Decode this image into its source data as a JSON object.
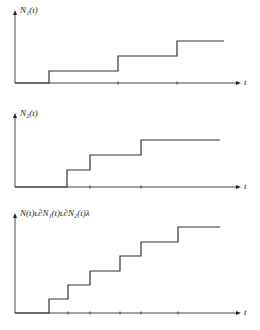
{
  "plots": [
    {
      "ylabel": "N₁(t)",
      "xlabel": "t",
      "axis_y": 83,
      "axis_top": 10,
      "steps": [
        [
          15,
          83
        ],
        [
          49,
          83
        ],
        [
          49,
          71
        ],
        [
          118,
          71
        ],
        [
          118,
          56
        ],
        [
          177,
          56
        ],
        [
          177,
          41
        ],
        [
          224,
          41
        ]
      ],
      "ticks": [
        118,
        177
      ]
    },
    {
      "ylabel": "N₂(t)",
      "xlabel": "t",
      "axis_y": 187,
      "axis_top": 113,
      "steps": [
        [
          15,
          187
        ],
        [
          67,
          187
        ],
        [
          67,
          170
        ],
        [
          90,
          170
        ],
        [
          90,
          155
        ],
        [
          141,
          155
        ],
        [
          141,
          140
        ],
        [
          220,
          140
        ]
      ],
      "ticks": [
        90,
        141
      ]
    },
    {
      "ylabel": "N(t)ʟ∂N₁(t)ʟ∂N₂(t)λ",
      "xlabel": "t",
      "axis_y": 313,
      "axis_top": 213,
      "steps": [
        [
          15,
          313
        ],
        [
          49,
          313
        ],
        [
          49,
          299
        ],
        [
          68,
          299
        ],
        [
          68,
          285
        ],
        [
          90,
          285
        ],
        [
          90,
          271
        ],
        [
          120,
          271
        ],
        [
          120,
          256
        ],
        [
          141,
          256
        ],
        [
          141,
          242
        ],
        [
          178,
          242
        ],
        [
          178,
          227
        ],
        [
          220,
          227
        ]
      ],
      "ticks": [
        68,
        90,
        120,
        141,
        178
      ]
    }
  ],
  "chart_data": [
    {
      "type": "line",
      "title": "",
      "ylabel": "N₁(t)",
      "xlabel": "t",
      "x": [
        0,
        1,
        2,
        3
      ],
      "values": [
        0,
        1,
        2,
        3
      ]
    },
    {
      "type": "line",
      "title": "",
      "ylabel": "N₂(t)",
      "xlabel": "t",
      "x": [
        0,
        1,
        2,
        3
      ],
      "values": [
        0,
        1,
        2,
        3
      ]
    },
    {
      "type": "line",
      "title": "",
      "ylabel": "N(t) = N₁(t) + N₂(t)",
      "xlabel": "t",
      "x": [
        0,
        1,
        2,
        3,
        4,
        5,
        6
      ],
      "values": [
        0,
        1,
        2,
        3,
        4,
        5,
        6
      ]
    }
  ]
}
